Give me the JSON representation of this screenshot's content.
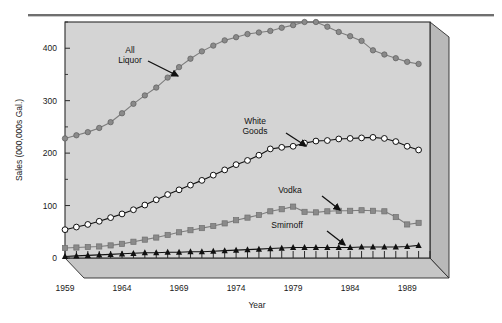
{
  "figure": {
    "background": "#ffffff",
    "plot_background": "#d4d4d4",
    "frame_color": "#2b2b2b",
    "side_panel_color": "#b9b9b9",
    "base_panel_color": "#c6c6c6",
    "rule_color": "#6f6f6f"
  },
  "chart_data": {
    "type": "line",
    "title": "",
    "xlabel": "Year",
    "ylabel": "Sales (000,000s Gal.)",
    "xlim": [
      1959,
      1991
    ],
    "ylim": [
      0,
      450
    ],
    "yticks": [
      0,
      100,
      200,
      300,
      400
    ],
    "ytick_labels": [
      "0",
      "100",
      "200",
      "300",
      "400"
    ],
    "xticks": [
      1959,
      1964,
      1969,
      1974,
      1979,
      1984,
      1989
    ],
    "xtick_labels": [
      "1959",
      "1964",
      "1969",
      "1974",
      "1979",
      "1984",
      "1989"
    ],
    "y_minor_ticks": [
      50,
      150,
      250,
      350,
      450
    ],
    "grid": false,
    "legend": "annotations",
    "x": [
      1959,
      1960,
      1961,
      1962,
      1963,
      1964,
      1965,
      1966,
      1967,
      1968,
      1969,
      1970,
      1971,
      1972,
      1973,
      1974,
      1975,
      1976,
      1977,
      1978,
      1979,
      1980,
      1981,
      1982,
      1983,
      1984,
      1985,
      1986,
      1987,
      1988,
      1989,
      1990
    ],
    "series": [
      {
        "name": "All Liquor",
        "color": "#8a8a8a",
        "marker": "circle-filled",
        "values": [
          228,
          234,
          240,
          248,
          259,
          276,
          294,
          310,
          325,
          344,
          364,
          380,
          394,
          405,
          415,
          421,
          427,
          430,
          433,
          439,
          444,
          450,
          450,
          441,
          431,
          423,
          414,
          396,
          388,
          381,
          374,
          370
        ]
      },
      {
        "name": "White Goods",
        "color": "#ffffff",
        "marker": "circle-open",
        "values": [
          54,
          59,
          64,
          70,
          77,
          84,
          92,
          101,
          111,
          121,
          130,
          139,
          148,
          158,
          168,
          178,
          186,
          196,
          208,
          211,
          213,
          219,
          223,
          224,
          227,
          228,
          229,
          230,
          228,
          222,
          213,
          206
        ]
      },
      {
        "name": "Vodka",
        "color": "#8a8a8a",
        "marker": "square-filled",
        "values": [
          19,
          20,
          21,
          22,
          24,
          27,
          31,
          35,
          39,
          44,
          49,
          53,
          57,
          61,
          66,
          72,
          77,
          82,
          89,
          93,
          98,
          88,
          87,
          89,
          90,
          90,
          91,
          90,
          89,
          78,
          64,
          67
        ]
      },
      {
        "name": "Smirnoff",
        "color": "#111111",
        "marker": "triangle-filled",
        "values": [
          3,
          4,
          5,
          6,
          7,
          8,
          9,
          10,
          10,
          11,
          11,
          12,
          12,
          13,
          14,
          15,
          16,
          17,
          18,
          19,
          20,
          20,
          20,
          20,
          20,
          20,
          21,
          21,
          21,
          21,
          22,
          24
        ]
      }
    ],
    "annotations": [
      {
        "label_line1": "All",
        "label_line2": "Liquor",
        "text_x": 130,
        "text_y": 53,
        "arrow_from_x": 148,
        "arrow_from_y": 61,
        "arrow_to_x": 178,
        "arrow_to_y": 76
      },
      {
        "label_line1": "White",
        "label_line2": "Goods",
        "text_x": 255,
        "text_y": 124,
        "arrow_from_x": 286,
        "arrow_from_y": 133,
        "arrow_to_x": 306,
        "arrow_to_y": 146
      },
      {
        "label_line1": "Vodka",
        "label_line2": "",
        "text_x": 290,
        "text_y": 193,
        "arrow_from_x": 322,
        "arrow_from_y": 196,
        "arrow_to_x": 340,
        "arrow_to_y": 210
      },
      {
        "label_line1": "Smirnoff",
        "label_line2": "",
        "text_x": 287,
        "text_y": 228,
        "arrow_from_x": 327,
        "arrow_from_y": 231,
        "arrow_to_x": 345,
        "arrow_to_y": 245
      }
    ]
  }
}
